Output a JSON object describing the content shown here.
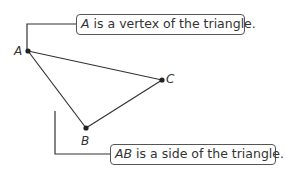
{
  "diagram": {
    "points": [
      {
        "name": "A",
        "x": 28,
        "y": 51
      },
      {
        "name": "B",
        "x": 86,
        "y": 128
      },
      {
        "name": "C",
        "x": 162,
        "y": 80
      }
    ],
    "callouts": [
      {
        "emphasis": "A",
        "text": " is a vertex of the triangle."
      },
      {
        "emphasis": "AB",
        "text": " is a side of the triangle."
      }
    ],
    "colors": {
      "line": "#333333",
      "text": "#333333",
      "border": "#555555"
    }
  }
}
